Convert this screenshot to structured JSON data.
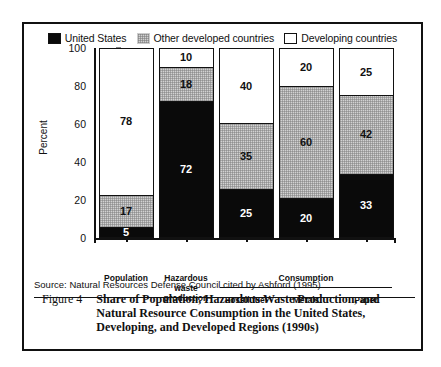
{
  "figure": {
    "number_label": "Figure 4",
    "caption": "Share of Population, Hazardous Waste Production, and Natural Resource Consumption in the United States, Developing, and Developed Regions (1990s)",
    "source": "Source:  Natural Resources Defense Council cited by Ashford (1995)"
  },
  "legend": {
    "items": [
      {
        "label": "United States",
        "swatch": "black-square-icon",
        "color": "#0a0a0a"
      },
      {
        "label": "Other developed countries",
        "swatch": "gray-square-icon",
        "color": "#d2d2d2"
      },
      {
        "label": "Developing countries",
        "swatch": "white-square-icon",
        "color": "#ffffff"
      }
    ]
  },
  "chart_data": {
    "type": "bar",
    "subtype": "stacked",
    "title": "Share of Population, Hazardous Waste Production, and Natural Resource Consumption in the United States, Developing, and Developed Regions (1990s)",
    "xlabel": "",
    "ylabel": "Percent",
    "ylim": [
      0,
      100
    ],
    "yticks": [
      0,
      20,
      40,
      60,
      80,
      100
    ],
    "ytick_labels": [
      "0",
      "20",
      "40",
      "60",
      "80",
      "100"
    ],
    "grid": false,
    "legend_position": "top",
    "categories": [
      "Population",
      "Hazardous waste production",
      "Fossil fuel",
      "Metals",
      "Paper"
    ],
    "category_group": {
      "label": "Consumption",
      "members": [
        "Fossil fuel",
        "Metals",
        "Paper"
      ]
    },
    "series": [
      {
        "name": "United States",
        "color": "#0a0a0a",
        "values": [
          5,
          72,
          25,
          20,
          33
        ]
      },
      {
        "name": "Other developed countries",
        "color": "#d2d2d2",
        "values": [
          17,
          18,
          35,
          60,
          42
        ]
      },
      {
        "name": "Developing countries",
        "color": "#ffffff",
        "values": [
          78,
          10,
          40,
          20,
          25
        ]
      }
    ]
  },
  "axis": {
    "y_title": "Percent"
  }
}
